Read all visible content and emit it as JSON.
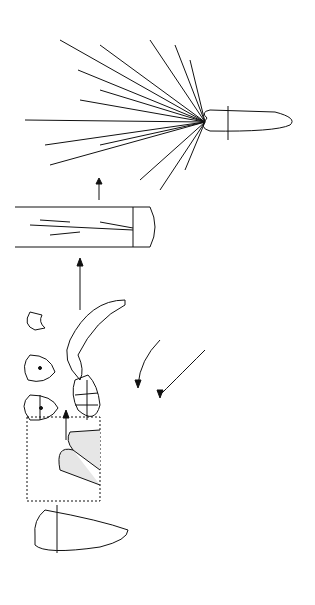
{
  "diagram": {
    "orientation": "rotated 90 degrees counter-clockwise",
    "labels": {
      "flowering_plant": "Flowering\nplant",
      "plantlet": "Plantlet",
      "flower": "Flower",
      "seed": "Seed",
      "phloem_explants": "Phloem\nexplants",
      "cells_from_embryo": "Cells from\nembryo",
      "cells_from_phloem": "Cells from\nphloem",
      "embryoid": "Embryoid\nfrom cultured\nfree cells",
      "free_cells": "Free cells in\nsuspension",
      "portion_flask": "Portion of\nculture\nflask",
      "explants_cultured": "Explants\ncultured in\nmedium plus\ncoconut milk",
      "phloem_2mg": "2 mg Phloem\nexplants",
      "storage_root": "Storage\nroot",
      "transverse_section": "Transverse section\nof the root"
    },
    "colors": {
      "ink": "#111111",
      "background": "#ffffff",
      "stipple": "#bbbbbb"
    }
  }
}
